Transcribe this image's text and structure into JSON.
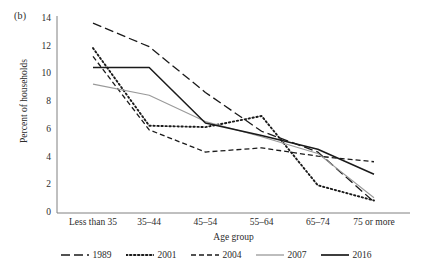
{
  "figure": {
    "panel_label": "(b)"
  },
  "chart_data": {
    "type": "line",
    "title": "",
    "xlabel": "Age group",
    "ylabel": "Percent of households",
    "categories": [
      "Less than 35",
      "35–44",
      "45–54",
      "55–64",
      "65–74",
      "75 or more"
    ],
    "ylim": [
      0,
      14
    ],
    "yticks": [
      0,
      2,
      4,
      6,
      8,
      10,
      12,
      14
    ],
    "ytick_labels": [
      "0",
      "2",
      "4",
      "6",
      "8",
      "10",
      "12",
      "14"
    ],
    "grid": false,
    "legend_position": "bottom",
    "series": [
      {
        "name": "1989",
        "style": "long-dash",
        "color": "#1a1a1a",
        "values": [
          13.7,
          12.0,
          8.7,
          5.9,
          4.4,
          0.8
        ]
      },
      {
        "name": "2001",
        "style": "dotted",
        "color": "#1a1a1a",
        "values": [
          11.9,
          6.3,
          6.2,
          7.0,
          2.0,
          0.9
        ]
      },
      {
        "name": "2004",
        "style": "dash",
        "color": "#1a1a1a",
        "values": [
          11.3,
          6.0,
          4.4,
          4.7,
          4.1,
          3.7
        ]
      },
      {
        "name": "2007",
        "style": "solid-gray",
        "color": "#9a9a9a",
        "values": [
          9.3,
          8.5,
          6.6,
          5.5,
          4.3,
          1.1
        ]
      },
      {
        "name": "2016",
        "style": "solid-black",
        "color": "#1a1a1a",
        "values": [
          10.5,
          10.5,
          6.5,
          5.6,
          4.6,
          2.8
        ]
      }
    ]
  },
  "legend": {
    "items": [
      {
        "label": "1989",
        "style": "long-dash",
        "color": "#1a1a1a"
      },
      {
        "label": "2001",
        "style": "dotted",
        "color": "#1a1a1a"
      },
      {
        "label": "2004",
        "style": "dash",
        "color": "#1a1a1a"
      },
      {
        "label": "2007",
        "style": "solid-gray",
        "color": "#9a9a9a"
      },
      {
        "label": "2016",
        "style": "solid-black",
        "color": "#1a1a1a"
      }
    ]
  },
  "axes": {
    "line_color": "#808080"
  }
}
